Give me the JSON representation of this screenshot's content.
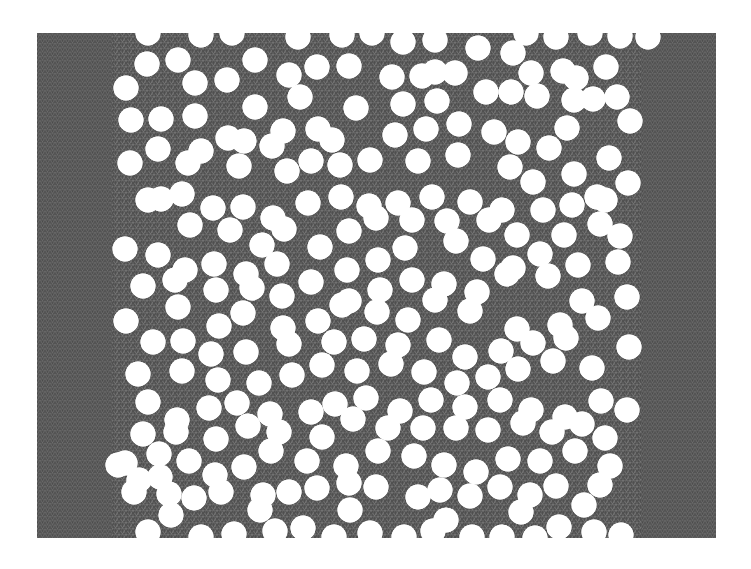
{
  "figure": {
    "domain": {
      "x": 37,
      "y": 33,
      "width": 679,
      "height": 505
    },
    "colors": {
      "mesh": "#555555",
      "mesh_light": "#7a7a7a",
      "mesh_dark": "#3a3a3a",
      "hole": "#ffffff",
      "background": "#ffffff"
    },
    "hole_radius": 12.5,
    "holes": [
      [
        148,
        33
      ],
      [
        201,
        35
      ],
      [
        232,
        33
      ],
      [
        298,
        37
      ],
      [
        342,
        35
      ],
      [
        372,
        33
      ],
      [
        403,
        42
      ],
      [
        435,
        40
      ],
      [
        526,
        33
      ],
      [
        556,
        37
      ],
      [
        590,
        33
      ],
      [
        620,
        36
      ],
      [
        648,
        37
      ],
      [
        147,
        64
      ],
      [
        178,
        60
      ],
      [
        255,
        60
      ],
      [
        317,
        67
      ],
      [
        349,
        66
      ],
      [
        435,
        72
      ],
      [
        478,
        48
      ],
      [
        513,
        53
      ],
      [
        531,
        73
      ],
      [
        563,
        71
      ],
      [
        606,
        67
      ],
      [
        126,
        88
      ],
      [
        195,
        83
      ],
      [
        227,
        80
      ],
      [
        289,
        75
      ],
      [
        392,
        77
      ],
      [
        422,
        76
      ],
      [
        455,
        73
      ],
      [
        576,
        78
      ],
      [
        486,
        92
      ],
      [
        537,
        96
      ],
      [
        574,
        100
      ],
      [
        617,
        97
      ],
      [
        131,
        120
      ],
      [
        161,
        119
      ],
      [
        195,
        116
      ],
      [
        255,
        107
      ],
      [
        300,
        97
      ],
      [
        244,
        141
      ],
      [
        283,
        131
      ],
      [
        318,
        129
      ],
      [
        356,
        108
      ],
      [
        403,
        104
      ],
      [
        437,
        101
      ],
      [
        511,
        92
      ],
      [
        593,
        99
      ],
      [
        630,
        121
      ],
      [
        158,
        149
      ],
      [
        130,
        163
      ],
      [
        188,
        163
      ],
      [
        228,
        138
      ],
      [
        332,
        140
      ],
      [
        272,
        146
      ],
      [
        395,
        135
      ],
      [
        426,
        129
      ],
      [
        459,
        124
      ],
      [
        494,
        132
      ],
      [
        518,
        142
      ],
      [
        549,
        148
      ],
      [
        609,
        158
      ],
      [
        567,
        128
      ],
      [
        161,
        199
      ],
      [
        201,
        151
      ],
      [
        239,
        166
      ],
      [
        287,
        171
      ],
      [
        311,
        161
      ],
      [
        340,
        165
      ],
      [
        370,
        160
      ],
      [
        418,
        161
      ],
      [
        458,
        155
      ],
      [
        510,
        167
      ],
      [
        533,
        182
      ],
      [
        574,
        174
      ],
      [
        597,
        197
      ],
      [
        628,
        183
      ],
      [
        148,
        200
      ],
      [
        182,
        194
      ],
      [
        213,
        208
      ],
      [
        243,
        207
      ],
      [
        273,
        218
      ],
      [
        308,
        203
      ],
      [
        341,
        197
      ],
      [
        369,
        206
      ],
      [
        398,
        203
      ],
      [
        432,
        197
      ],
      [
        470,
        202
      ],
      [
        502,
        210
      ],
      [
        543,
        210
      ],
      [
        572,
        205
      ],
      [
        605,
        200
      ],
      [
        190,
        225
      ],
      [
        230,
        230
      ],
      [
        262,
        245
      ],
      [
        284,
        229
      ],
      [
        349,
        231
      ],
      [
        376,
        218
      ],
      [
        412,
        220
      ],
      [
        447,
        221
      ],
      [
        489,
        220
      ],
      [
        517,
        235
      ],
      [
        564,
        235
      ],
      [
        600,
        224
      ],
      [
        620,
        236
      ],
      [
        125,
        249
      ],
      [
        158,
        255
      ],
      [
        185,
        270
      ],
      [
        214,
        264
      ],
      [
        246,
        274
      ],
      [
        277,
        264
      ],
      [
        320,
        247
      ],
      [
        347,
        270
      ],
      [
        378,
        260
      ],
      [
        405,
        248
      ],
      [
        456,
        241
      ],
      [
        483,
        259
      ],
      [
        513,
        268
      ],
      [
        540,
        254
      ],
      [
        578,
        265
      ],
      [
        618,
        262
      ],
      [
        143,
        286
      ],
      [
        175,
        280
      ],
      [
        216,
        290
      ],
      [
        252,
        288
      ],
      [
        282,
        296
      ],
      [
        311,
        282
      ],
      [
        349,
        301
      ],
      [
        380,
        290
      ],
      [
        412,
        280
      ],
      [
        444,
        284
      ],
      [
        477,
        292
      ],
      [
        507,
        274
      ],
      [
        548,
        276
      ],
      [
        582,
        301
      ],
      [
        627,
        297
      ],
      [
        126,
        321
      ],
      [
        178,
        307
      ],
      [
        219,
        326
      ],
      [
        243,
        313
      ],
      [
        283,
        328
      ],
      [
        318,
        321
      ],
      [
        342,
        305
      ],
      [
        377,
        312
      ],
      [
        408,
        320
      ],
      [
        435,
        300
      ],
      [
        470,
        311
      ],
      [
        517,
        329
      ],
      [
        560,
        325
      ],
      [
        598,
        318
      ],
      [
        153,
        342
      ],
      [
        183,
        341
      ],
      [
        211,
        354
      ],
      [
        246,
        352
      ],
      [
        289,
        344
      ],
      [
        334,
        342
      ],
      [
        364,
        339
      ],
      [
        398,
        345
      ],
      [
        439,
        340
      ],
      [
        465,
        357
      ],
      [
        501,
        351
      ],
      [
        533,
        343
      ],
      [
        566,
        338
      ],
      [
        629,
        347
      ],
      [
        138,
        374
      ],
      [
        182,
        371
      ],
      [
        218,
        380
      ],
      [
        259,
        383
      ],
      [
        292,
        375
      ],
      [
        322,
        365
      ],
      [
        357,
        371
      ],
      [
        391,
        364
      ],
      [
        424,
        372
      ],
      [
        457,
        383
      ],
      [
        488,
        377
      ],
      [
        518,
        369
      ],
      [
        553,
        361
      ],
      [
        592,
        368
      ],
      [
        148,
        402
      ],
      [
        177,
        420
      ],
      [
        209,
        408
      ],
      [
        237,
        403
      ],
      [
        270,
        414
      ],
      [
        311,
        412
      ],
      [
        335,
        404
      ],
      [
        366,
        398
      ],
      [
        400,
        411
      ],
      [
        431,
        400
      ],
      [
        465,
        407
      ],
      [
        500,
        400
      ],
      [
        531,
        410
      ],
      [
        565,
        417
      ],
      [
        601,
        401
      ],
      [
        627,
        410
      ],
      [
        143,
        434
      ],
      [
        176,
        432
      ],
      [
        216,
        439
      ],
      [
        248,
        426
      ],
      [
        279,
        432
      ],
      [
        322,
        437
      ],
      [
        353,
        419
      ],
      [
        388,
        428
      ],
      [
        423,
        428
      ],
      [
        456,
        428
      ],
      [
        488,
        430
      ],
      [
        523,
        423
      ],
      [
        552,
        432
      ],
      [
        582,
        424
      ],
      [
        605,
        438
      ],
      [
        125,
        463
      ],
      [
        159,
        454
      ],
      [
        189,
        461
      ],
      [
        215,
        475
      ],
      [
        244,
        467
      ],
      [
        271,
        451
      ],
      [
        307,
        461
      ],
      [
        346,
        466
      ],
      [
        378,
        451
      ],
      [
        414,
        456
      ],
      [
        444,
        465
      ],
      [
        476,
        472
      ],
      [
        508,
        459
      ],
      [
        540,
        461
      ],
      [
        575,
        451
      ],
      [
        610,
        466
      ],
      [
        160,
        477
      ],
      [
        134,
        492
      ],
      [
        169,
        494
      ],
      [
        194,
        498
      ],
      [
        221,
        492
      ],
      [
        263,
        495
      ],
      [
        289,
        492
      ],
      [
        317,
        488
      ],
      [
        349,
        483
      ],
      [
        376,
        487
      ],
      [
        418,
        497
      ],
      [
        440,
        490
      ],
      [
        470,
        496
      ],
      [
        500,
        487
      ],
      [
        530,
        495
      ],
      [
        556,
        486
      ],
      [
        600,
        485
      ],
      [
        148,
        532
      ],
      [
        201,
        537
      ],
      [
        234,
        534
      ],
      [
        275,
        531
      ],
      [
        303,
        528
      ],
      [
        334,
        537
      ],
      [
        370,
        533
      ],
      [
        404,
        537
      ],
      [
        433,
        531
      ],
      [
        472,
        537
      ],
      [
        502,
        537
      ],
      [
        535,
        538
      ],
      [
        559,
        527
      ],
      [
        594,
        532
      ],
      [
        621,
        535
      ],
      [
        118,
        465
      ],
      [
        139,
        480
      ],
      [
        171,
        515
      ],
      [
        260,
        510
      ],
      [
        350,
        510
      ],
      [
        446,
        520
      ],
      [
        521,
        512
      ],
      [
        584,
        505
      ]
    ]
  }
}
